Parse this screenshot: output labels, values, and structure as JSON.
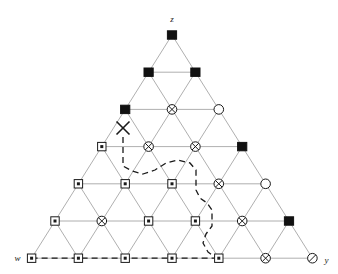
{
  "figure": {
    "title": "",
    "type": "triangular-lattice-diagram",
    "width": 338,
    "height": 274,
    "background": "#ffffff",
    "lattice_color": "#9a9a9a",
    "marker_stroke": "#1a1a1a",
    "filled_color": "#111111",
    "path_color": "#1a1a1a"
  },
  "labels": {
    "apex": "z",
    "bottom_left": "w",
    "bottom_right": "y"
  },
  "legend_glyphs": {
    "filled_square": "filled-square-marker",
    "dotted_square": "square-with-dot-marker",
    "crossed_circle": "circle-with-x-marker",
    "open_circle": "open-circle-marker",
    "slashed_circle": "circle-with-slash-marker",
    "cross": "x-cross-marker"
  },
  "lattice": {
    "rows": 7,
    "apex_x": 172,
    "apex_y": 35,
    "row_spacing": 37.2,
    "col_spacing": 46.8,
    "description": "Triangular (Pascal) lattice, row i has i+1 nodes"
  },
  "nodes": [
    {
      "row": 0,
      "col": 0,
      "x": 172,
      "y": 35,
      "type": "filled_square"
    },
    {
      "row": 1,
      "col": 0,
      "x": 148.6,
      "y": 72.2,
      "type": "filled_square"
    },
    {
      "row": 1,
      "col": 1,
      "x": 195.4,
      "y": 72.2,
      "type": "filled_square"
    },
    {
      "row": 2,
      "col": 0,
      "x": 125.2,
      "y": 109.4,
      "type": "filled_square"
    },
    {
      "row": 2,
      "col": 1,
      "x": 172.0,
      "y": 109.4,
      "type": "crossed_circle"
    },
    {
      "row": 2,
      "col": 2,
      "x": 218.8,
      "y": 109.4,
      "type": "open_circle"
    },
    {
      "row": 3,
      "col": 0,
      "x": 101.8,
      "y": 146.6,
      "type": "dotted_square"
    },
    {
      "row": 3,
      "col": 1,
      "x": 148.6,
      "y": 146.6,
      "type": "crossed_circle"
    },
    {
      "row": 3,
      "col": 2,
      "x": 195.4,
      "y": 146.6,
      "type": "crossed_circle"
    },
    {
      "row": 3,
      "col": 3,
      "x": 242.2,
      "y": 146.6,
      "type": "filled_square"
    },
    {
      "row": 4,
      "col": 0,
      "x": 78.4,
      "y": 183.8,
      "type": "dotted_square"
    },
    {
      "row": 4,
      "col": 1,
      "x": 125.2,
      "y": 183.8,
      "type": "dotted_square"
    },
    {
      "row": 4,
      "col": 2,
      "x": 172.0,
      "y": 183.8,
      "type": "dotted_square"
    },
    {
      "row": 4,
      "col": 3,
      "x": 218.8,
      "y": 183.8,
      "type": "crossed_circle"
    },
    {
      "row": 4,
      "col": 4,
      "x": 265.6,
      "y": 183.8,
      "type": "open_circle"
    },
    {
      "row": 5,
      "col": 0,
      "x": 55.0,
      "y": 221.0,
      "type": "dotted_square"
    },
    {
      "row": 5,
      "col": 1,
      "x": 101.8,
      "y": 221.0,
      "type": "crossed_circle"
    },
    {
      "row": 5,
      "col": 2,
      "x": 148.6,
      "y": 221.0,
      "type": "dotted_square"
    },
    {
      "row": 5,
      "col": 3,
      "x": 195.4,
      "y": 221.0,
      "type": "dotted_square"
    },
    {
      "row": 5,
      "col": 4,
      "x": 242.2,
      "y": 221.0,
      "type": "crossed_circle"
    },
    {
      "row": 5,
      "col": 5,
      "x": 289.0,
      "y": 221.0,
      "type": "filled_square"
    },
    {
      "row": 6,
      "col": 0,
      "x": 31.6,
      "y": 258.2,
      "type": "dotted_square"
    },
    {
      "row": 6,
      "col": 1,
      "x": 78.4,
      "y": 258.2,
      "type": "dotted_square"
    },
    {
      "row": 6,
      "col": 2,
      "x": 125.2,
      "y": 258.2,
      "type": "dotted_square"
    },
    {
      "row": 6,
      "col": 3,
      "x": 172.0,
      "y": 258.2,
      "type": "dotted_square"
    },
    {
      "row": 6,
      "col": 4,
      "x": 218.8,
      "y": 258.2,
      "type": "dotted_square"
    },
    {
      "row": 6,
      "col": 5,
      "x": 265.6,
      "y": 258.2,
      "type": "crossed_circle"
    },
    {
      "row": 6,
      "col": 6,
      "x": 312.4,
      "y": 258.2,
      "type": "slashed_circle"
    }
  ],
  "cross_marker": {
    "x": 123,
    "y": 128,
    "size": 13,
    "label": "x-cross-marker"
  },
  "dashed_path": {
    "stroke_dash": "6,4",
    "points": "123,137 123,166 132,171 143,174 155,170 166,163 178,160 190,163 196,170 196,190 200,198 207,203 212,210 212,226 206,234 203,243 208,252 215,257 218,258"
  },
  "dashed_baseline": {
    "stroke_dash": "6,4",
    "x1": 31.6,
    "y1": 258.2,
    "x2": 218.8,
    "y2": 258.2
  }
}
